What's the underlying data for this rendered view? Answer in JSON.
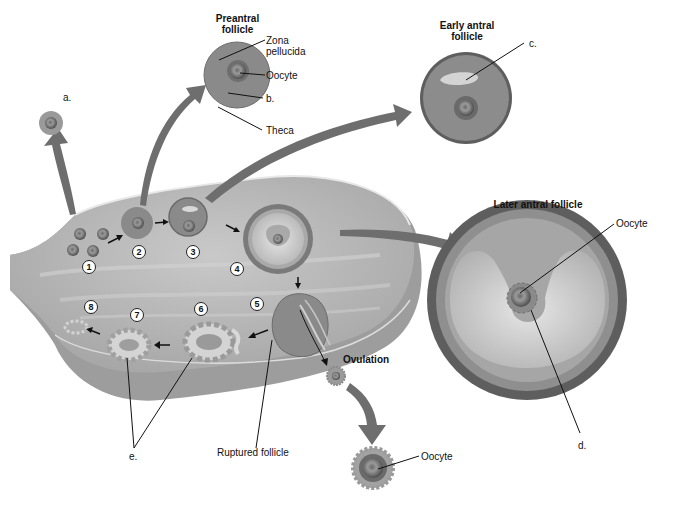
{
  "figure": {
    "stage_titles": {
      "preantral": "Preantral follicle",
      "early_antral": "Early antral follicle",
      "later_antral": "Later antral follicle",
      "ovulation": "Ovulation"
    },
    "labels": {
      "zona_pellucida": "Zona pellucida",
      "oocyte_preantral": "Oocyte",
      "theca": "Theca",
      "oocyte_later_antral": "Oocyte",
      "oocyte_ovulated": "Oocyte",
      "ruptured_follicle": "Ruptured follicle"
    },
    "blank_labels": {
      "a": "a.",
      "b": "b.",
      "c": "c.",
      "d": "d.",
      "e": "e."
    },
    "stage_numbers": [
      "1",
      "2",
      "3",
      "4",
      "5",
      "6",
      "7",
      "8"
    ],
    "colors": {
      "ovary": "#b8b8b8",
      "ovary_dark": "#8e8e8e",
      "follicle_granulosa": "#8a8a8a",
      "theca_dark": "#5c5c5c",
      "antrum": "#d6d6d6",
      "arrow": "#6e6e6e"
    }
  }
}
